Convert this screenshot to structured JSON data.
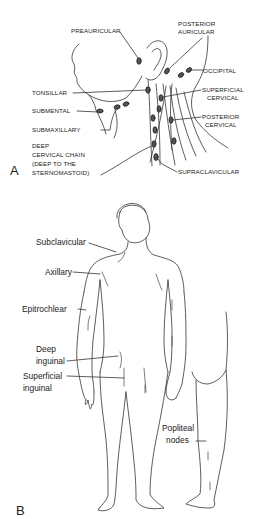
{
  "panel_a": {
    "letter": "A",
    "labels": {
      "preauricular": "PREAURICULAR",
      "posterior_auricular_1": "POSTERIOR",
      "posterior_auricular_2": "AURICULAR",
      "occipital": "OCCIPITAL",
      "tonsillar": "TONSILLAR",
      "superficial_cervical_1": "SUPERFICIAL",
      "superficial_cervical_2": "CERVICAL",
      "submental": "SUBMENTAL",
      "posterior_cervical_1": "POSTERIOR",
      "posterior_cervical_2": "CERVICAL",
      "submaxillary": "SUBMAXILLARY",
      "deep_cervical_1": "DEEP",
      "deep_cervical_2": "CERVICAL CHAIN",
      "deep_cervical_3": "(DEEP TO THE",
      "deep_cervical_4": "STERNOMASTOID)",
      "supraclavicular": "SUPRACLAVICULAR"
    }
  },
  "panel_b": {
    "letter": "B",
    "labels": {
      "subclavicular": "Subclavicular",
      "axillary": "Axillary",
      "epitrochlear": "Epitrochlear",
      "deep_inguinal_1": "Deep",
      "deep_inguinal_2": "inguinal",
      "superficial_inguinal_1": "Superficial",
      "superficial_inguinal_2": "inguinal",
      "popliteal_1": "Popliteal",
      "popliteal_2": "nodes"
    }
  }
}
